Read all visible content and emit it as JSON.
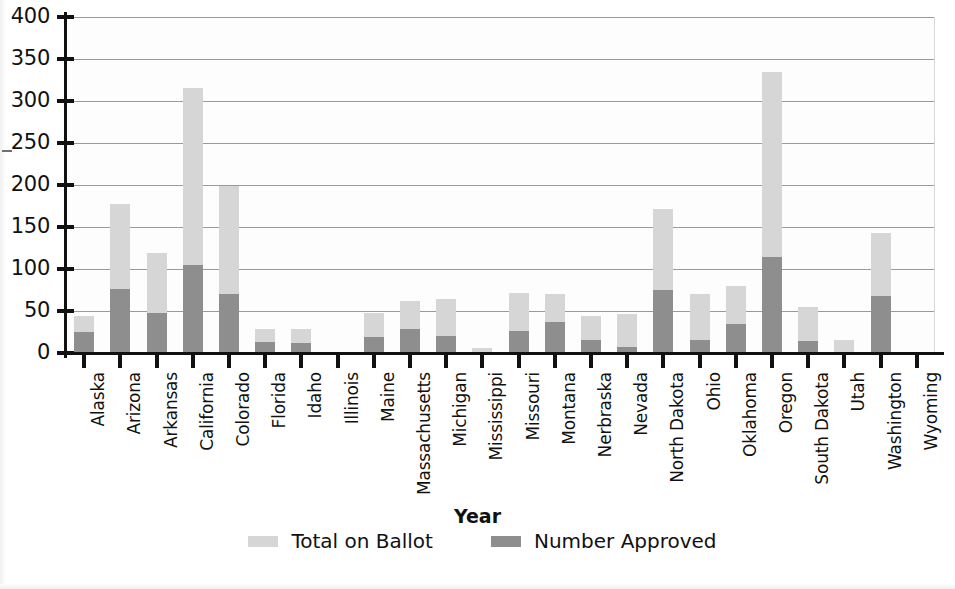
{
  "chart_data": {
    "type": "bar",
    "subtype": "overlaid-two-series",
    "title": "",
    "xlabel": "Year",
    "ylabel": "",
    "ylim": [
      0,
      400
    ],
    "ytick_step": 50,
    "yticks": [
      "400",
      "350",
      "300",
      "250",
      "200",
      "150",
      "100",
      "50",
      "0"
    ],
    "grid": true,
    "legend_position": "bottom-center",
    "categories": [
      "Alaska",
      "Arizona",
      "Arkansas",
      "California",
      "Colorado",
      "Florida",
      "Idaho",
      "Illinois",
      "Maine",
      "Massachusetts",
      "Michigan",
      "Mississippi",
      "Missouri",
      "Montana",
      "Nerbraska",
      "Nevada",
      "North Dakota",
      "Ohio",
      "Oklahoma",
      "Oregon",
      "South Dakota",
      "Utah",
      "Washington",
      "Wyoming"
    ],
    "series": [
      {
        "name": "Total on Ballot",
        "color": "#d6d6d6",
        "values": [
          44,
          177,
          119,
          316,
          199,
          29,
          28,
          0,
          48,
          62,
          64,
          6,
          72,
          70,
          44,
          47,
          171,
          70,
          80,
          335,
          55,
          15,
          143,
          0
        ]
      },
      {
        "name": "Number Approved",
        "color": "#8e8e8e",
        "values": [
          25,
          76,
          48,
          105,
          70,
          13,
          12,
          0,
          19,
          29,
          20,
          0,
          26,
          37,
          16,
          7,
          75,
          15,
          34,
          114,
          14,
          1,
          68,
          0
        ]
      }
    ]
  },
  "legend": {
    "items": [
      {
        "label": "Total on Ballot",
        "color": "#d6d6d6"
      },
      {
        "label": "Number Approved",
        "color": "#8e8e8e"
      }
    ]
  },
  "axis": {
    "x_title": "Year"
  }
}
